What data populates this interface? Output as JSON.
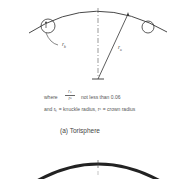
{
  "figure_a": {
    "labels": {
      "knuckle_radius": "r",
      "knuckle_radius_sub": "k",
      "crown_radius": "r",
      "crown_radius_sub": "c"
    },
    "condition": {
      "where": "where",
      "numerator": "rₖ",
      "denominator": "rᶜ",
      "rule": "not less than 0.06"
    },
    "definition": "and rₖ = knuckle radius, rᶜ = crown radius",
    "caption": "(a)  Torisphere"
  },
  "figure_b": {
    "caption": ""
  }
}
